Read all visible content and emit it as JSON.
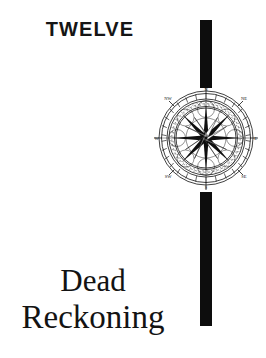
{
  "page": {
    "background_color": "#ffffff",
    "ink_color": "#121212"
  },
  "chapter": {
    "number_word": "TWELVE",
    "title_line_1": "Dead",
    "title_line_2": "Reckoning"
  },
  "ornament": {
    "rule_top_name": "vertical-rule-top",
    "rule_bottom_name": "vertical-rule-bottom",
    "rule_color": "#0d0d0d"
  },
  "compass": {
    "label": "compass-rose",
    "points": [
      "N",
      "NE",
      "E",
      "SE",
      "S",
      "SW",
      "W",
      "NW"
    ],
    "star_points": 16,
    "ring_count": 4,
    "tick_count": 32
  }
}
